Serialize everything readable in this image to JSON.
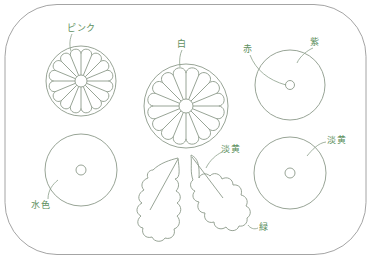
{
  "diagram": {
    "type": "embroidery-pattern",
    "colors": {
      "label": "#5d8f5e",
      "outline": "#8c9a8a",
      "frame": "#9a9a9a"
    },
    "elements": {
      "pink_flower": {
        "label": "ピンク",
        "shape": "chrysanthemum",
        "petals": 16
      },
      "white_flower": {
        "label": "白",
        "shape": "chrysanthemum",
        "petals": 16
      },
      "top_right_circle": {
        "label_outer": "紫",
        "label_center": "赤"
      },
      "bottom_left_circle": {
        "label": "水色"
      },
      "bottom_right_circle": {
        "label": "淡黄"
      },
      "leaves": {
        "vein_label": "淡黄",
        "leaf_label": "緑"
      }
    }
  }
}
